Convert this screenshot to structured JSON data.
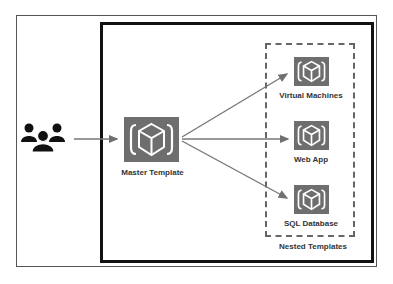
{
  "diagram": {
    "actor": {
      "icon": "users-group-icon",
      "label": ""
    },
    "master": {
      "label": "Master Template",
      "icon": "template-cube-icon"
    },
    "nested_group": {
      "label": "Nested Templates",
      "items": [
        {
          "label": "Virtual Machines",
          "icon": "template-cube-icon"
        },
        {
          "label": "Web App",
          "icon": "template-cube-icon"
        },
        {
          "label": "SQL Database",
          "icon": "template-cube-icon"
        }
      ]
    },
    "edges": [
      {
        "from": "users",
        "to": "Master Template"
      },
      {
        "from": "Master Template",
        "to": "Virtual Machines"
      },
      {
        "from": "Master Template",
        "to": "Web App"
      },
      {
        "from": "Master Template",
        "to": "SQL Database"
      }
    ],
    "colors": {
      "tile": "#6e6e6e",
      "border": "#111111",
      "dashed": "#666666",
      "arrow": "#707070"
    }
  }
}
